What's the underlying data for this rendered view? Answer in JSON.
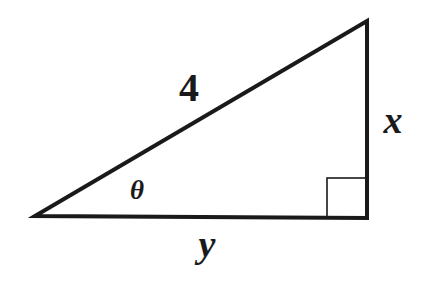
{
  "diagram": {
    "type": "right-triangle",
    "colors": {
      "stroke": "#1a1a1a",
      "background": "#ffffff"
    },
    "vertices": {
      "left": [
        35,
        216
      ],
      "top": [
        367,
        21
      ],
      "right_angle": [
        367,
        218
      ]
    },
    "right_angle_marker": {
      "x": 327,
      "y": 178,
      "size": 40
    },
    "labels": {
      "hypotenuse": "4",
      "opposite": "x",
      "adjacent": "y",
      "angle": "θ"
    }
  }
}
